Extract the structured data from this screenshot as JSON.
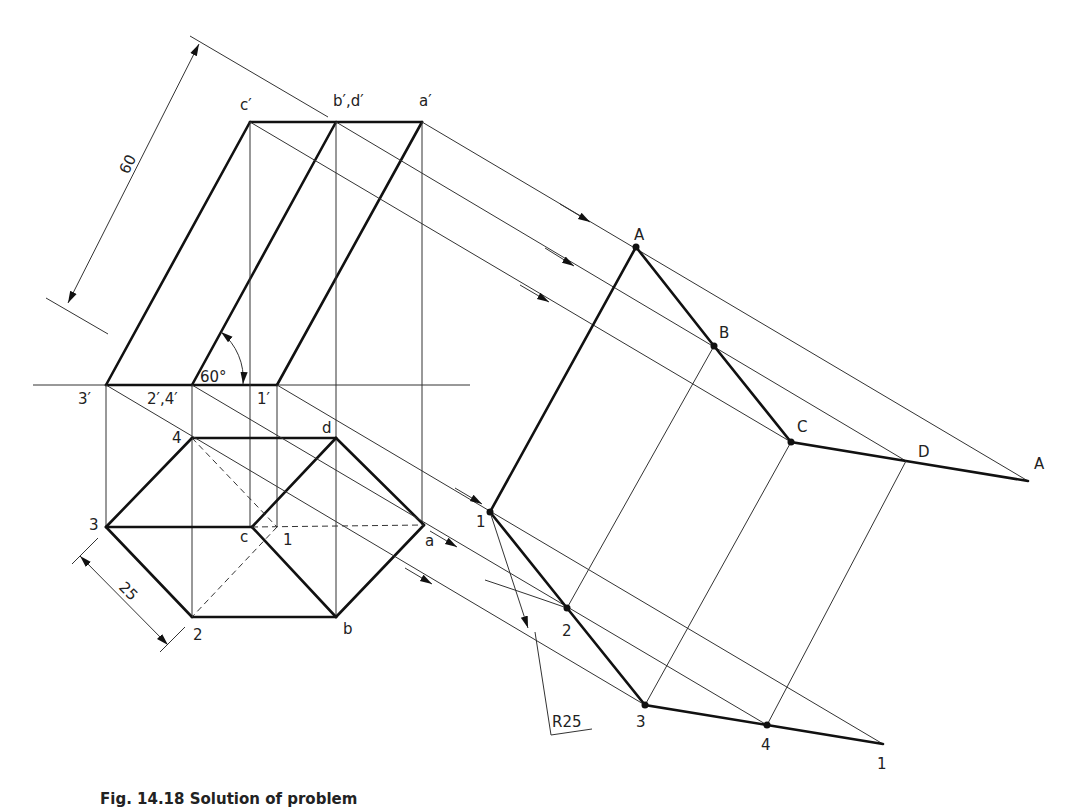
{
  "figure": {
    "caption": "Fig. 14.18 Solution of problem"
  },
  "dimensions": {
    "height": "60",
    "side": "25",
    "angle": "60°",
    "radius": "R25"
  },
  "elevation_labels": {
    "c_prime": "c′",
    "bd_prime": "b′,d′",
    "a_prime": "a′",
    "three_prime": "3′",
    "two_four_prime": "2′,4′",
    "one_prime": "1′"
  },
  "plan_labels": {
    "four": "4",
    "d": "d",
    "three": "3",
    "c": "c",
    "one": "1",
    "a": "a",
    "two": "2",
    "b": "b"
  },
  "development_labels": {
    "A_top": "A",
    "B": "B",
    "C": "C",
    "D": "D",
    "A_end": "A",
    "one_start": "1",
    "two": "2",
    "three": "3",
    "four": "4",
    "one_end": "1"
  }
}
